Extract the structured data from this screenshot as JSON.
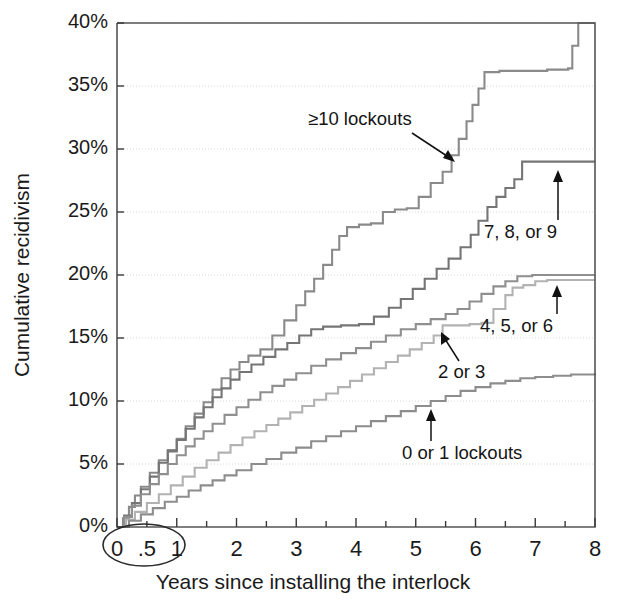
{
  "chart_data": {
    "type": "line",
    "title": "",
    "xlabel": "Years since installing the interlock",
    "ylabel": "Cumulative recidivism",
    "xlim": [
      0,
      8
    ],
    "ylim": [
      0,
      40
    ],
    "grid": true,
    "legend_position": "inline-annotations",
    "x_tick_labels": [
      "0",
      ".5",
      "1",
      "2",
      "3",
      "4",
      "5",
      "6",
      "7",
      "8"
    ],
    "x_tick_values": [
      0,
      0.5,
      1,
      2,
      3,
      4,
      5,
      6,
      7,
      8
    ],
    "x_minor_ticks": [
      0.5,
      1.5,
      2.5,
      3.5,
      4.5,
      5.5,
      6.5,
      7.5
    ],
    "y_tick_labels": [
      "0%",
      "5%",
      "10%",
      "15%",
      "20%",
      "25%",
      "30%",
      "35%",
      "40%"
    ],
    "y_tick_values": [
      0,
      5,
      10,
      15,
      20,
      25,
      30,
      35,
      40
    ],
    "annotations": [
      {
        "text": "≥10 lockouts",
        "series": "ge10"
      },
      {
        "text": "7, 8, or 9",
        "series": "s789"
      },
      {
        "text": "4, 5, or 6",
        "series": "s456"
      },
      {
        "text": "2 or 3",
        "series": "s23"
      },
      {
        "text": "0 or 1 lockouts",
        "series": "s01"
      }
    ],
    "highlight_marker": {
      "shape": "ellipse",
      "encircles": [
        "0",
        ".5"
      ],
      "note": "ellipse drawn around the 0 and .5 x-axis tick labels"
    },
    "series": [
      {
        "name": "≥10 lockouts",
        "key": "ge10",
        "color": "#8a8a8a",
        "final_value": 40.0,
        "points": [
          [
            0.0,
            0.0
          ],
          [
            0.1,
            0.7
          ],
          [
            0.2,
            1.6
          ],
          [
            0.3,
            2.5
          ],
          [
            0.4,
            3.2
          ],
          [
            0.55,
            4.3
          ],
          [
            0.7,
            5.3
          ],
          [
            0.85,
            6.1
          ],
          [
            1.0,
            7.0
          ],
          [
            1.15,
            8.0
          ],
          [
            1.3,
            9.0
          ],
          [
            1.45,
            9.9
          ],
          [
            1.6,
            10.9
          ],
          [
            1.75,
            11.8
          ],
          [
            1.9,
            12.5
          ],
          [
            2.05,
            13.1
          ],
          [
            2.2,
            13.6
          ],
          [
            2.4,
            14.1
          ],
          [
            2.6,
            15.2
          ],
          [
            2.8,
            16.4
          ],
          [
            3.0,
            17.6
          ],
          [
            3.15,
            18.7
          ],
          [
            3.3,
            19.7
          ],
          [
            3.45,
            20.8
          ],
          [
            3.6,
            22.0
          ],
          [
            3.72,
            23.1
          ],
          [
            3.85,
            23.8
          ],
          [
            4.05,
            24.0
          ],
          [
            4.25,
            24.1
          ],
          [
            4.45,
            25.0
          ],
          [
            4.65,
            25.2
          ],
          [
            4.85,
            25.3
          ],
          [
            5.05,
            26.2
          ],
          [
            5.25,
            27.3
          ],
          [
            5.45,
            28.2
          ],
          [
            5.6,
            29.5
          ],
          [
            5.72,
            30.8
          ],
          [
            5.85,
            32.2
          ],
          [
            5.95,
            33.5
          ],
          [
            6.05,
            34.8
          ],
          [
            6.15,
            36.1
          ],
          [
            6.4,
            36.2
          ],
          [
            7.2,
            36.3
          ],
          [
            7.55,
            36.4
          ],
          [
            7.62,
            38.2
          ],
          [
            7.72,
            40.0
          ],
          [
            8.0,
            40.0
          ]
        ]
      },
      {
        "name": "7, 8, or 9",
        "key": "s789",
        "color": "#757575",
        "final_value": 29.0,
        "points": [
          [
            0.0,
            0.0
          ],
          [
            0.12,
            0.9
          ],
          [
            0.25,
            1.9
          ],
          [
            0.4,
            3.0
          ],
          [
            0.55,
            4.0
          ],
          [
            0.7,
            5.1
          ],
          [
            0.85,
            6.0
          ],
          [
            1.0,
            6.9
          ],
          [
            1.15,
            7.8
          ],
          [
            1.3,
            8.7
          ],
          [
            1.45,
            9.5
          ],
          [
            1.6,
            10.3
          ],
          [
            1.75,
            11.0
          ],
          [
            1.9,
            11.7
          ],
          [
            2.05,
            12.3
          ],
          [
            2.25,
            12.9
          ],
          [
            2.45,
            13.5
          ],
          [
            2.65,
            14.1
          ],
          [
            2.85,
            14.6
          ],
          [
            3.05,
            15.2
          ],
          [
            3.25,
            15.7
          ],
          [
            3.45,
            15.9
          ],
          [
            3.75,
            16.0
          ],
          [
            4.05,
            16.1
          ],
          [
            4.3,
            16.7
          ],
          [
            4.55,
            17.4
          ],
          [
            4.75,
            18.1
          ],
          [
            4.95,
            18.9
          ],
          [
            5.15,
            19.7
          ],
          [
            5.35,
            20.5
          ],
          [
            5.55,
            21.3
          ],
          [
            5.75,
            22.2
          ],
          [
            5.92,
            23.2
          ],
          [
            6.05,
            24.3
          ],
          [
            6.2,
            25.4
          ],
          [
            6.35,
            26.2
          ],
          [
            6.5,
            26.9
          ],
          [
            6.65,
            27.6
          ],
          [
            6.78,
            29.0
          ],
          [
            7.0,
            29.0
          ],
          [
            8.0,
            29.0
          ]
        ]
      },
      {
        "name": "4, 5, or 6",
        "key": "s456",
        "color": "#8f8f8f",
        "final_value": 20.0,
        "points": [
          [
            0.0,
            0.0
          ],
          [
            0.12,
            0.8
          ],
          [
            0.25,
            1.7
          ],
          [
            0.4,
            2.6
          ],
          [
            0.55,
            3.4
          ],
          [
            0.7,
            4.2
          ],
          [
            0.85,
            5.0
          ],
          [
            1.0,
            5.7
          ],
          [
            1.15,
            6.4
          ],
          [
            1.3,
            7.0
          ],
          [
            1.45,
            7.6
          ],
          [
            1.6,
            8.2
          ],
          [
            1.8,
            8.9
          ],
          [
            2.0,
            9.5
          ],
          [
            2.2,
            10.1
          ],
          [
            2.4,
            10.7
          ],
          [
            2.6,
            11.2
          ],
          [
            2.8,
            11.7
          ],
          [
            3.0,
            12.2
          ],
          [
            3.25,
            12.8
          ],
          [
            3.5,
            13.3
          ],
          [
            3.75,
            13.8
          ],
          [
            4.0,
            14.2
          ],
          [
            4.25,
            14.7
          ],
          [
            4.5,
            15.2
          ],
          [
            4.75,
            15.7
          ],
          [
            5.0,
            16.1
          ],
          [
            5.25,
            16.5
          ],
          [
            5.5,
            16.9
          ],
          [
            5.7,
            17.3
          ],
          [
            5.9,
            17.9
          ],
          [
            6.1,
            18.5
          ],
          [
            6.3,
            19.1
          ],
          [
            6.5,
            19.5
          ],
          [
            6.7,
            19.9
          ],
          [
            6.95,
            20.0
          ],
          [
            7.4,
            20.0
          ],
          [
            8.0,
            20.0
          ]
        ]
      },
      {
        "name": "2 or 3",
        "key": "s23",
        "color": "#b2b2b2",
        "final_value": 19.6,
        "points": [
          [
            0.0,
            0.0
          ],
          [
            0.15,
            0.6
          ],
          [
            0.3,
            1.2
          ],
          [
            0.5,
            1.9
          ],
          [
            0.7,
            2.6
          ],
          [
            0.9,
            3.3
          ],
          [
            1.1,
            4.0
          ],
          [
            1.3,
            4.7
          ],
          [
            1.5,
            5.3
          ],
          [
            1.7,
            5.9
          ],
          [
            1.9,
            6.5
          ],
          [
            2.1,
            7.1
          ],
          [
            2.3,
            7.6
          ],
          [
            2.5,
            8.1
          ],
          [
            2.7,
            8.6
          ],
          [
            2.9,
            9.1
          ],
          [
            3.1,
            9.6
          ],
          [
            3.3,
            10.1
          ],
          [
            3.5,
            10.6
          ],
          [
            3.7,
            11.1
          ],
          [
            3.9,
            11.6
          ],
          [
            4.1,
            12.1
          ],
          [
            4.3,
            12.6
          ],
          [
            4.5,
            13.1
          ],
          [
            4.7,
            13.6
          ],
          [
            4.9,
            14.1
          ],
          [
            5.1,
            14.6
          ],
          [
            5.3,
            15.2
          ],
          [
            5.45,
            16.0
          ],
          [
            5.6,
            16.0
          ],
          [
            5.9,
            16.1
          ],
          [
            6.1,
            16.2
          ],
          [
            6.3,
            17.3
          ],
          [
            6.5,
            18.4
          ],
          [
            6.62,
            19.0
          ],
          [
            6.8,
            19.2
          ],
          [
            7.0,
            19.5
          ],
          [
            7.2,
            19.6
          ],
          [
            8.0,
            19.6
          ]
        ]
      },
      {
        "name": "0 or 1 lockouts",
        "key": "s01",
        "color": "#8d8d8d",
        "final_value": 12.2,
        "points": [
          [
            0.0,
            0.0
          ],
          [
            0.2,
            0.5
          ],
          [
            0.4,
            1.0
          ],
          [
            0.6,
            1.5
          ],
          [
            0.8,
            2.0
          ],
          [
            1.0,
            2.4
          ],
          [
            1.2,
            2.9
          ],
          [
            1.4,
            3.3
          ],
          [
            1.6,
            3.7
          ],
          [
            1.8,
            4.1
          ],
          [
            2.0,
            4.5
          ],
          [
            2.25,
            5.0
          ],
          [
            2.5,
            5.4
          ],
          [
            2.75,
            5.9
          ],
          [
            3.0,
            6.3
          ],
          [
            3.25,
            6.8
          ],
          [
            3.5,
            7.2
          ],
          [
            3.75,
            7.6
          ],
          [
            4.0,
            8.0
          ],
          [
            4.25,
            8.4
          ],
          [
            4.5,
            8.8
          ],
          [
            4.75,
            9.2
          ],
          [
            5.0,
            9.6
          ],
          [
            5.25,
            10.0
          ],
          [
            5.5,
            10.4
          ],
          [
            5.75,
            10.8
          ],
          [
            6.0,
            11.1
          ],
          [
            6.25,
            11.4
          ],
          [
            6.5,
            11.6
          ],
          [
            6.75,
            11.8
          ],
          [
            7.0,
            11.9
          ],
          [
            7.3,
            12.0
          ],
          [
            7.6,
            12.1
          ],
          [
            8.0,
            12.2
          ]
        ]
      }
    ]
  },
  "axis": {
    "y_label": "Cumulative recidivism",
    "x_label": "Years since installing the interlock",
    "y_ticks": [
      "40%",
      "35%",
      "30%",
      "25%",
      "20%",
      "15%",
      "10%",
      "5%",
      "0%"
    ],
    "x_ticks": [
      "0",
      ".5",
      "1",
      "2",
      "3",
      "4",
      "5",
      "6",
      "7",
      "8"
    ]
  },
  "labels": {
    "ge10": "≥10 lockouts",
    "s789": "7, 8, or 9",
    "s456": "4, 5, or 6",
    "s23": "2 or 3",
    "s01": "0 or 1 lockouts"
  }
}
